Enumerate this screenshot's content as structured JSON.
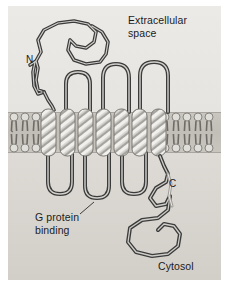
{
  "figure": {
    "background_color": "#e3e1dd",
    "membrane_color": "#c2bfb8",
    "ribbon_color": "#4a4a4a",
    "helix_color": "#c6c4bf"
  },
  "labels": {
    "extracellular": "Extracellular\nspace",
    "cytosol": "Cytosol",
    "g_protein_binding": "G protein\nbinding",
    "n_terminus": "N",
    "c_terminus": "C"
  },
  "membrane": {
    "name": "lipid-bilayer",
    "top_y": 106,
    "bottom_y": 147,
    "leaflets": 2,
    "left_phospholipid_heads": 3,
    "right_phospholipid_heads": 5,
    "head_color": "#d9d7d2",
    "tail_color": "#6e6b66"
  },
  "protein": {
    "name": "seven-transmembrane-receptor",
    "transmembrane_helix_count": 7,
    "helix_x_positions": [
      36,
      55,
      73,
      91,
      109,
      127,
      146
    ],
    "extracellular_loops": 3,
    "cytosolic_loops": 3,
    "n_terminus_side": "extracellular",
    "c_terminus_side": "cytosol"
  }
}
